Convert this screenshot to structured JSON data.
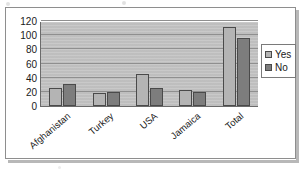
{
  "chart_data": {
    "type": "bar",
    "title": "",
    "xlabel": "",
    "ylabel": "",
    "ylim": [
      0,
      120
    ],
    "ytick_step": 20,
    "yticks": [
      "120",
      "100",
      "80",
      "60",
      "40",
      "20",
      "0"
    ],
    "grid": true,
    "legend_position": "right",
    "categories": [
      "Afghanistan",
      "Turkey",
      "USA",
      "Jamaica",
      "Total"
    ],
    "series": [
      {
        "name": "Yes",
        "color": "#b4b4b4",
        "values": [
          26,
          18,
          45,
          23,
          112
        ]
      },
      {
        "name": "No",
        "color": "#7d7d7d",
        "values": [
          31,
          20,
          26,
          20,
          96
        ]
      }
    ]
  },
  "legend": {
    "items": [
      {
        "label": "Yes",
        "swatch": "legend-swatch-yes"
      },
      {
        "label": "No",
        "swatch": "legend-swatch-no"
      }
    ]
  },
  "colors": {
    "plot_background": "#c3c3c3",
    "gridline": "#8f8f8f",
    "axis": "#6b6b6b",
    "bar_yes": "#b4b4b4",
    "bar_no": "#7d7d7d",
    "frame_border": "#8e8e8e",
    "text": "#1a1a1a"
  }
}
